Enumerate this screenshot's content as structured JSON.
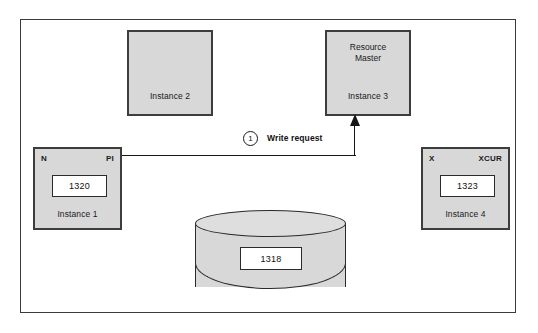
{
  "diagram": {
    "frame": {
      "border_color": "#3a3a3a"
    },
    "colors": {
      "box_fill": "#d8d8d8",
      "box_border": "#3d3d3d",
      "value_box_fill": "#ffffff",
      "value_box_border": "#2b2b2b",
      "line": "#171717",
      "text": "#1a1a1a",
      "canvas": "#ffffff"
    },
    "nodes": {
      "instance1": {
        "caption": "Instance 1",
        "corner_left_label": "N",
        "corner_right_label": "PI",
        "value": "1320"
      },
      "instance2": {
        "caption": "Instance 2"
      },
      "instance3": {
        "title": "Resource\nMaster",
        "caption": "Instance 3"
      },
      "instance4": {
        "caption": "Instance 4",
        "corner_left_label": "X",
        "corner_right_label": "XCUR",
        "value": "1323"
      },
      "database": {
        "value": "1318",
        "shape": "cylinder"
      }
    },
    "flows": [
      {
        "step_number": "1",
        "label": "Write request",
        "from": "instance1",
        "to": "instance3",
        "arrow": "arrowhead-up-icon"
      }
    ]
  }
}
